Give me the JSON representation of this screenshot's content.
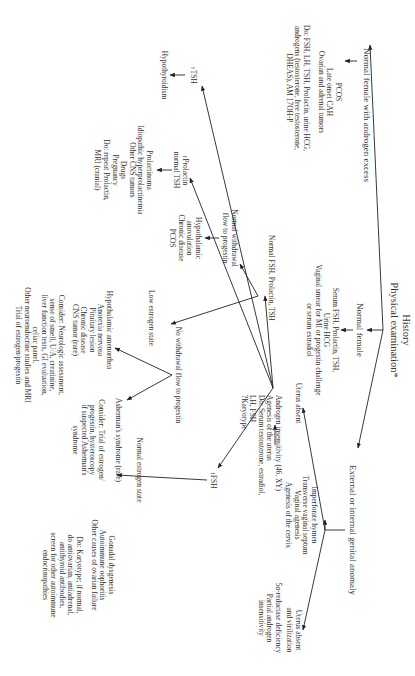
{
  "diagram": {
    "orientation": "rotated 90 degrees clockwise",
    "colors": {
      "line": "#222222",
      "text": "#333333",
      "background": "#ffffff"
    },
    "root": {
      "lines": [
        "History",
        "Physical examination*"
      ]
    },
    "branches": {
      "androgen_excess": {
        "label": "Normal female with androgen excess",
        "causes": [
          "PCOS",
          "Late onset CAH",
          "Ovarian and adrenal tumors"
        ],
        "workup": [
          "Do: FSH, LH, TSH, Prolactin, urine HCG,",
          "androgens (testosterone, free testosterone,",
          "DHEAS), AM 17OH-P"
        ]
      },
      "normal_female": {
        "label": "Normal female",
        "tests": [
          "Serum FSH, Prolactin, TSH,",
          "Urine HCG",
          "Vaginal smear for MI or progestin challenge",
          "or serum estradiol"
        ],
        "tsh": {
          "label": "TSH",
          "result": "Hypothyroidism"
        },
        "prolactin": {
          "label": [
            "Prolactin",
            "normal TSH"
          ],
          "causes": [
            "Prolactinoma",
            "Idiopathic hyperprolactinemia",
            "Other CNS tumors",
            "Drugs",
            "Pregnancy",
            "Do: repeat Prolactin,",
            "MRI (cranial)"
          ]
        },
        "normal_labs": {
          "label": "Normal FSH, Prolactin, TSH",
          "withdrawal": {
            "label": [
              "Normal withdrawal",
              "flow to progestin"
            ],
            "causes": [
              "Hypothalamic",
              "anovulation",
              "Chronic disease",
              "PCOS"
            ]
          },
          "no_withdrawal": {
            "label": "No withdrawal flow to progestin",
            "low_estrogen": {
              "label": "Low estrogen state",
              "causes": [
                "Hypothalamic amenorrhea",
                "Anorexia nervosa",
                "Pituitary lesion",
                "Chronic disease",
                "CNS tumor (rare)"
              ],
              "consider": [
                "Consider: Neurologic assessment,",
                "sense of smell, U/A, creatinine,",
                "liver function tests, GI evaluation,",
                "celiac panel.",
                "Other neuroendocrine studies and MRI",
                "Trial of estrogen/progestin"
              ]
            },
            "normal_estrogen": {
              "label": "Normal estrogen state",
              "causes": [
                "Asherman's syndrome (rare)"
              ],
              "consider": [
                "Consider: Trial of estrogen/",
                "progestin, hysteroscopy",
                "if suspected Asherman's",
                "syndrome"
              ]
            }
          }
        },
        "fsh": {
          "label": "FSH",
          "causes": [
            "Gonadal dysgenesis",
            "Autoimmune oophoritis",
            "Other causes of ovarian failure"
          ],
          "workup": [
            "Do: Karyotype; if normal,",
            "do antiovarian, antiadrenal,",
            "antithyroid antibodies,",
            "screen for other autoimmune",
            "endocrinopathies"
          ]
        }
      },
      "genital_anomaly": {
        "label": "External or internal genital anomaly",
        "uterus_absent_a": {
          "label": "Uterus absent",
          "causes": [
            "Androgen insensitivity (46, XY)",
            "Agenesis of the uterus",
            "Do: Serum testosterone, estradiol,",
            "LH, FSH",
            "?Karyotype"
          ]
        },
        "outflow": {
          "label": "Imperforate hymen",
          "causes": [
            "Transverse vaginal septum",
            "Vaginal agenesis",
            "Agenesis of the cervix"
          ]
        },
        "uterus_absent_b": {
          "label": [
            "Uterus absent",
            "and virilization"
          ],
          "causes": [
            "5α-reductase deficiency",
            "Partial androgen",
            "insensitivity"
          ]
        }
      }
    },
    "arrow_up_glyph": "↑"
  }
}
